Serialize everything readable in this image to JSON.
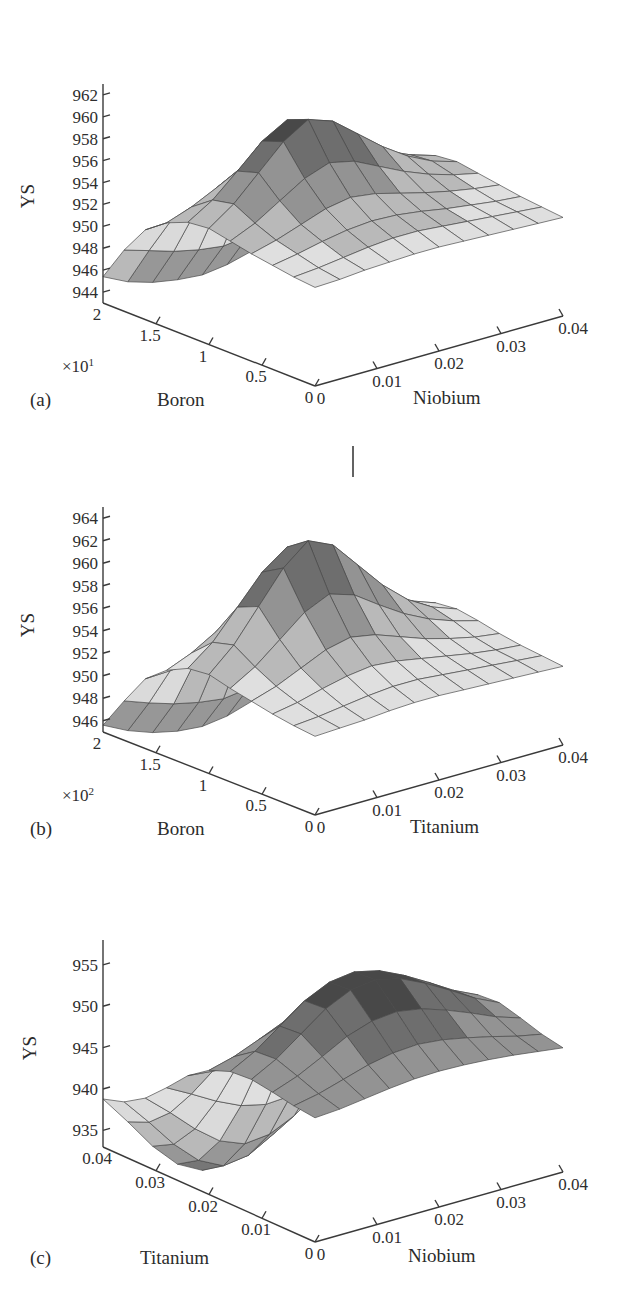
{
  "figure": {
    "kind": "three-panel-3d-surface-figure",
    "panels": [
      "a",
      "b",
      "c"
    ]
  },
  "chart_data": [
    {
      "id": "a",
      "type": "surface",
      "panel_label": "(a)",
      "title": "",
      "zlabel": "YS",
      "xlabel": "Boron",
      "ylabel": "Niobium",
      "x_multiplier": "×10",
      "x_multiplier_exponent": "1",
      "x_multiplier_text": "×10¹",
      "xticks": [
        "2",
        "1.5",
        "1",
        "0.5",
        "0"
      ],
      "xtick_values": [
        2,
        1.5,
        1,
        0.5,
        0
      ],
      "yticks": [
        "0",
        "0.01",
        "0.02",
        "0.03",
        "0.04"
      ],
      "ytick_values": [
        0,
        0.01,
        0.02,
        0.03,
        0.04
      ],
      "zticks": [
        "944",
        "946",
        "948",
        "950",
        "952",
        "954",
        "956",
        "958",
        "960",
        "962"
      ],
      "ztick_values": [
        944,
        946,
        948,
        950,
        952,
        954,
        956,
        958,
        960,
        962
      ],
      "zlim": [
        943,
        963
      ],
      "xlim": [
        0,
        2
      ],
      "ylim": [
        0,
        0.04
      ],
      "grid": true,
      "colormap": "grayscale",
      "n_grid_x": 11,
      "n_grid_y": 11,
      "surface_z": [
        [
          952.0,
          952.1,
          952.3,
          952.4,
          952.5,
          952.5,
          952.4,
          952.3,
          952.2,
          952.1,
          952.0
        ],
        [
          952.2,
          952.4,
          952.7,
          953.0,
          953.2,
          953.2,
          953.0,
          952.8,
          952.6,
          952.4,
          952.2
        ],
        [
          952.5,
          952.9,
          953.4,
          953.8,
          954.0,
          953.9,
          953.6,
          953.2,
          952.9,
          952.6,
          952.4
        ],
        [
          952.8,
          953.4,
          954.2,
          955.0,
          955.4,
          955.1,
          954.5,
          953.9,
          953.4,
          953.0,
          952.7
        ],
        [
          953.2,
          954.2,
          955.6,
          957.0,
          957.8,
          957.3,
          956.2,
          955.1,
          954.2,
          953.5,
          953.0
        ],
        [
          953.6,
          955.2,
          957.4,
          959.6,
          961.0,
          960.2,
          958.4,
          956.6,
          955.1,
          954.0,
          953.3
        ],
        [
          953.4,
          954.8,
          956.8,
          958.9,
          960.2,
          959.5,
          957.9,
          956.2,
          954.8,
          953.8,
          953.1
        ],
        [
          952.6,
          953.4,
          954.5,
          955.7,
          956.4,
          956.0,
          955.1,
          954.1,
          953.3,
          952.8,
          952.4
        ],
        [
          951.2,
          951.3,
          951.5,
          951.7,
          951.8,
          951.7,
          951.5,
          951.3,
          951.1,
          951.0,
          950.9
        ],
        [
          948.6,
          947.9,
          947.2,
          946.7,
          946.4,
          946.7,
          947.2,
          947.8,
          948.3,
          948.7,
          949.0
        ],
        [
          945.4,
          944.3,
          943.6,
          943.2,
          943.0,
          943.3,
          943.9,
          944.6,
          945.3,
          945.8,
          946.2
        ]
      ]
    },
    {
      "id": "b",
      "type": "surface",
      "panel_label": "(b)",
      "title": "",
      "zlabel": "YS",
      "xlabel": "Boron",
      "ylabel": "Titanium",
      "x_multiplier": "×10",
      "x_multiplier_exponent": "2",
      "x_multiplier_text": "×10²",
      "xticks": [
        "2",
        "1.5",
        "1",
        "0.5",
        "0"
      ],
      "xtick_values": [
        2,
        1.5,
        1,
        0.5,
        0
      ],
      "yticks": [
        "0",
        "0.01",
        "0.02",
        "0.03",
        "0.04"
      ],
      "ytick_values": [
        0,
        0.01,
        0.02,
        0.03,
        0.04
      ],
      "zticks": [
        "946",
        "948",
        "950",
        "952",
        "954",
        "956",
        "958",
        "960",
        "962",
        "964"
      ],
      "ztick_values": [
        946,
        948,
        950,
        952,
        954,
        956,
        958,
        960,
        962,
        964
      ],
      "zlim": [
        945,
        965
      ],
      "xlim": [
        0,
        2
      ],
      "ylim": [
        0,
        0.04
      ],
      "grid": true,
      "colormap": "grayscale",
      "n_grid_x": 11,
      "n_grid_y": 11,
      "has_top_spike": true,
      "surface_z": [
        [
          952.0,
          952.1,
          952.2,
          952.4,
          952.5,
          952.5,
          952.4,
          952.3,
          952.2,
          952.1,
          952.0
        ],
        [
          952.2,
          952.4,
          952.7,
          953.0,
          953.2,
          953.2,
          953.0,
          952.8,
          952.6,
          952.4,
          952.2
        ],
        [
          952.5,
          952.9,
          953.5,
          954.0,
          954.3,
          954.1,
          953.7,
          953.3,
          952.9,
          952.6,
          952.4
        ],
        [
          952.9,
          953.6,
          954.6,
          955.6,
          956.1,
          955.7,
          954.9,
          954.1,
          953.5,
          953.0,
          952.7
        ],
        [
          953.3,
          954.6,
          956.4,
          958.2,
          959.2,
          958.5,
          957.0,
          955.6,
          954.5,
          953.7,
          953.1
        ],
        [
          953.8,
          955.8,
          958.6,
          961.4,
          963.2,
          962.2,
          959.8,
          957.4,
          955.5,
          954.2,
          953.4
        ],
        [
          953.6,
          955.3,
          957.8,
          960.3,
          961.9,
          961.0,
          958.9,
          956.7,
          955.1,
          954.0,
          953.2
        ],
        [
          952.7,
          953.6,
          954.9,
          956.2,
          957.0,
          956.5,
          955.5,
          954.3,
          953.5,
          952.9,
          952.5
        ],
        [
          951.2,
          951.3,
          951.5,
          951.7,
          951.9,
          951.8,
          951.6,
          951.4,
          951.2,
          951.0,
          950.9
        ],
        [
          948.5,
          947.7,
          947.0,
          946.5,
          946.2,
          946.5,
          947.1,
          947.7,
          948.3,
          948.7,
          949.0
        ],
        [
          945.6,
          944.5,
          943.7,
          943.2,
          943.0,
          943.3,
          944.0,
          944.8,
          945.5,
          946.0,
          946.4
        ]
      ]
    },
    {
      "id": "c",
      "type": "surface",
      "panel_label": "(c)",
      "title": "",
      "zlabel": "YS",
      "xlabel": "Titanium",
      "ylabel": "Niobium",
      "x_multiplier": "",
      "x_multiplier_exponent": "",
      "x_multiplier_text": "",
      "xticks": [
        "0.04",
        "0.03",
        "0.02",
        "0.01",
        "0"
      ],
      "xtick_values": [
        0.04,
        0.03,
        0.02,
        0.01,
        0
      ],
      "yticks": [
        "0",
        "0.01",
        "0.02",
        "0.03",
        "0.04"
      ],
      "ytick_values": [
        0,
        0.01,
        0.02,
        0.03,
        0.04
      ],
      "zticks": [
        "935",
        "940",
        "945",
        "950",
        "955"
      ],
      "ztick_values": [
        935,
        940,
        945,
        950,
        955
      ],
      "zlim": [
        933,
        958
      ],
      "xlim": [
        0,
        0.04
      ],
      "ylim": [
        0,
        0.04
      ],
      "grid": true,
      "colormap": "grayscale",
      "n_grid_x": 11,
      "n_grid_y": 11,
      "surface_z": [
        [
          948.0,
          948.2,
          948.6,
          949.0,
          949.3,
          949.4,
          949.3,
          949.1,
          948.8,
          948.4,
          948.0
        ],
        [
          948.3,
          948.9,
          949.8,
          950.7,
          951.3,
          951.5,
          951.2,
          950.6,
          949.9,
          949.1,
          948.5
        ],
        [
          948.8,
          949.9,
          951.4,
          953.0,
          954.0,
          954.3,
          953.8,
          952.8,
          951.6,
          950.3,
          949.3
        ],
        [
          949.2,
          950.8,
          953.0,
          955.2,
          956.6,
          957.0,
          956.3,
          954.9,
          953.2,
          951.4,
          950.0
        ],
        [
          949.0,
          950.6,
          952.8,
          955.0,
          956.4,
          956.8,
          956.1,
          954.7,
          953.0,
          951.2,
          949.8
        ],
        [
          948.0,
          948.8,
          950.0,
          951.3,
          952.2,
          952.4,
          952.0,
          951.2,
          950.2,
          949.2,
          948.4
        ],
        [
          946.2,
          945.9,
          945.7,
          945.6,
          945.6,
          945.7,
          945.8,
          945.9,
          946.0,
          946.1,
          946.2
        ],
        [
          943.6,
          942.0,
          940.3,
          938.9,
          938.2,
          938.4,
          939.3,
          940.7,
          942.2,
          943.4,
          944.3
        ],
        [
          941.2,
          938.6,
          935.8,
          933.5,
          932.3,
          932.6,
          934.0,
          936.2,
          938.6,
          940.5,
          941.9
        ],
        [
          939.6,
          936.3,
          932.8,
          930.0,
          928.5,
          928.9,
          930.6,
          933.2,
          936.1,
          938.4,
          940.1
        ],
        [
          938.8,
          935.2,
          931.4,
          928.4,
          926.8,
          927.2,
          929.0,
          931.8,
          934.9,
          937.4,
          939.2
        ]
      ]
    }
  ]
}
